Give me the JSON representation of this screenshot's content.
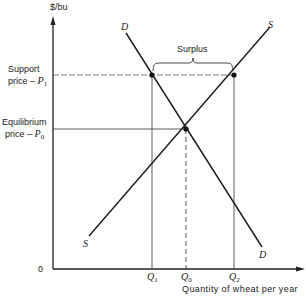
{
  "diagram": {
    "axes": {
      "y_label": "$/bu",
      "x_label": "Quantity of wheat per year",
      "origin_label": "0"
    },
    "price_labels": {
      "support": {
        "line1": "Support",
        "line2": "price – ",
        "symbol": "P",
        "sub": "1"
      },
      "equilibrium": {
        "line1": "Equilibrium",
        "line2": "price – ",
        "symbol": "P",
        "sub": "0"
      }
    },
    "quantity_labels": {
      "q1": {
        "symbol": "Q",
        "sub": "1"
      },
      "q0": {
        "symbol": "Q",
        "sub": "0"
      },
      "q2": {
        "symbol": "Q",
        "sub": "2"
      }
    },
    "curves": {
      "demand_top": "D",
      "demand_bottom": "D",
      "supply_top": "S",
      "supply_bottom": "S"
    },
    "annotation": "Surplus"
  }
}
